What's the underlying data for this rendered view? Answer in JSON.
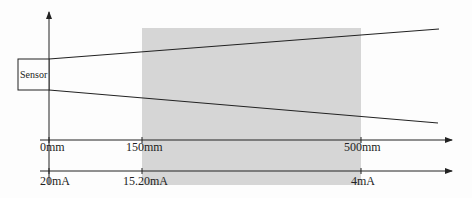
{
  "diagram": {
    "sensor_label": "Sensor",
    "measuring_range_fill": "#d6d6d6",
    "line_color": "#222222",
    "distance_axis": {
      "ticks": [
        {
          "label": "0mm",
          "x": 49
        },
        {
          "label": "150mm",
          "x": 142
        },
        {
          "label": "500mm",
          "x": 361
        }
      ]
    },
    "current_axis": {
      "ticks": [
        {
          "label": "20mA",
          "x": 49
        },
        {
          "label": "15.20mA",
          "x": 142
        },
        {
          "label": "4mA",
          "x": 361
        }
      ]
    }
  }
}
